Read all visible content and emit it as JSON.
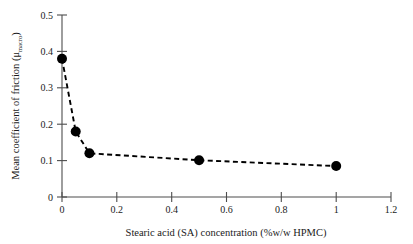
{
  "chart_data": {
    "type": "line",
    "title": "",
    "xlabel": "Stearic acid (SA) concentration (%w/w HPMC)",
    "ylabel_main": "Mean coefficient of friction (μ",
    "ylabel_sub": "macro",
    "ylabel_close": ")",
    "ylabel_full": "Mean coefficient of friction (μmacro)",
    "x": [
      0,
      0.05,
      0.1,
      0.5,
      1.0
    ],
    "values": [
      0.38,
      0.18,
      0.12,
      0.101,
      0.085
    ],
    "series": [
      {
        "name": "Mean coefficient of friction",
        "x": [
          0,
          0.05,
          0.1,
          0.5,
          1.0
        ],
        "values": [
          0.38,
          0.18,
          0.12,
          0.101,
          0.085
        ]
      }
    ],
    "xlim": [
      0,
      1.2
    ],
    "ylim": [
      0,
      0.5
    ],
    "xticks": [
      0,
      0.2,
      0.4,
      0.6,
      0.8,
      1,
      1.2
    ],
    "xtick_labels": [
      "0",
      "0.2",
      "0.4",
      "0.6",
      "0.8",
      "1",
      "1.2"
    ],
    "yticks": [
      0,
      0.1,
      0.2,
      0.3,
      0.4,
      0.5
    ],
    "ytick_labels": [
      "0",
      "0.1",
      "0.2",
      "0.3",
      "0.4",
      "0.5"
    ],
    "grid": false,
    "legend": false,
    "legend_position": "none",
    "line_style": "dashed",
    "marker_style": "filled-circle",
    "line_color": "#000000",
    "marker_color": "#000000",
    "axis_color": "#4d4d4d",
    "background_color": "#ffffff"
  }
}
